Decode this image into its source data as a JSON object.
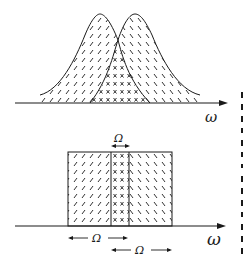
{
  "figure": {
    "top_panel": {
      "description": "Two overlapping bell-shaped spectra; left hatched '/', right hatched '\\', overlap region marked with x",
      "axis_label": "ω",
      "left_peak_x": 100,
      "right_peak_x": 135,
      "crossing_x": 118
    },
    "bottom_panel": {
      "description": "Two overlapping rectangular spectra of width Ω; overlap region of width Ω marked with x",
      "axis_label": "ω",
      "overlap_label": "Ω",
      "left_band_label": "Ω",
      "right_band_label": "Ω"
    },
    "hatch_symbols": {
      "left": "/",
      "right": "\\",
      "overlap": "×"
    },
    "colors": {
      "ink": "#1a1a1a",
      "background": "#ffffff"
    }
  }
}
